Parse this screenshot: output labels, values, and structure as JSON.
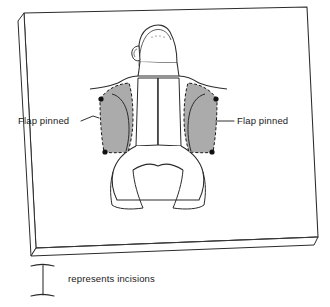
{
  "diagram": {
    "background_color": "#ffffff",
    "ink_color": "#1a1a1a",
    "board": {
      "name": "dissection-board",
      "top_face_color": "#ffffff",
      "edge_face_color": "#ffffff",
      "outline_color": "#2b2b2b"
    },
    "subject": {
      "name": "prone-specimen",
      "orientation": "dorsal view, head at top",
      "fill_color": "#ffffff",
      "outline_color": "#2b2b2b"
    },
    "flaps": [
      {
        "id": "left-flap",
        "side": "left",
        "fill_color": "#ababab",
        "border_style": "dashed",
        "pin_count": 2,
        "pin_color": "#111111"
      },
      {
        "id": "right-flap",
        "side": "right",
        "fill_color": "#ababab",
        "border_style": "dashed",
        "pin_count": 2,
        "pin_color": "#111111"
      }
    ],
    "labels": [
      {
        "id": "label-flap-pinned-left",
        "text": "Flap pinned",
        "side": "left",
        "anchor_x": 18,
        "anchor_y": 121
      },
      {
        "id": "label-flap-pinned-right",
        "text": "Flap pinned",
        "side": "right",
        "anchor_x": 237,
        "anchor_y": 121
      }
    ],
    "legend": {
      "id": "incision-legend",
      "symbol_name": "i-bar-incision-symbol",
      "text": "represents incisions"
    }
  }
}
